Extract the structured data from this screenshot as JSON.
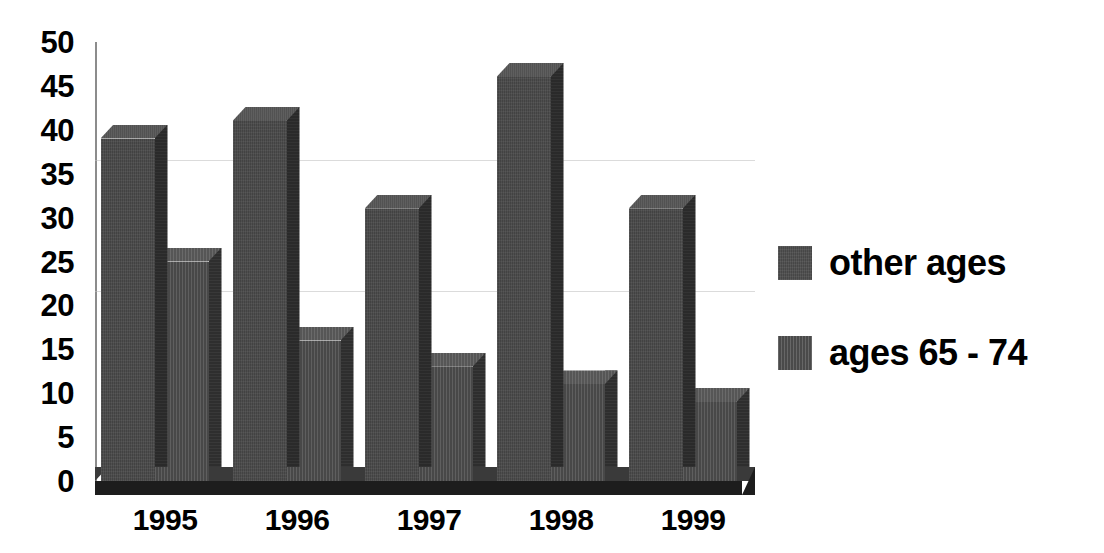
{
  "chart_data": {
    "type": "bar",
    "title": "",
    "subtitle": "",
    "xlabel": "",
    "ylabel": "",
    "categories": [
      "1995",
      "1996",
      "1997",
      "1998",
      "1999"
    ],
    "series": [
      {
        "name": "other ages",
        "values": [
          39,
          41,
          31,
          46,
          31
        ]
      },
      {
        "name": "ages 65 - 74",
        "values": [
          25,
          16,
          13,
          11,
          9
        ]
      }
    ],
    "ylim": [
      0,
      50
    ],
    "y_ticks": [
      0,
      5,
      10,
      15,
      20,
      25,
      30,
      35,
      40,
      45,
      50
    ],
    "y_tick_labels": [
      "0",
      "5",
      "10",
      "15",
      "20",
      "25",
      "30",
      "35",
      "40",
      "45",
      "50"
    ],
    "grid": true,
    "grid_axis": "y",
    "legend_position": "right",
    "style": "3d-clustered-column",
    "bar_color_other_ages": "#494949",
    "bar_color_ages_65_74": "#4d4d4d",
    "axis_color": "#8c8c8c",
    "text_color": "#000000",
    "background_color": "#ffffff"
  },
  "axes": {
    "y": {
      "ticks": [
        {
          "label": "50",
          "value": 50
        },
        {
          "label": "45",
          "value": 45
        },
        {
          "label": "40",
          "value": 40
        },
        {
          "label": "35",
          "value": 35
        },
        {
          "label": "30",
          "value": 30
        },
        {
          "label": "25",
          "value": 25
        },
        {
          "label": "20",
          "value": 20
        },
        {
          "label": "15",
          "value": 15
        },
        {
          "label": "10",
          "value": 10
        },
        {
          "label": "5",
          "value": 5
        },
        {
          "label": "0",
          "value": 0
        }
      ]
    },
    "x": {
      "ticks": [
        {
          "label": "1995"
        },
        {
          "label": "1996"
        },
        {
          "label": "1997"
        },
        {
          "label": "1998"
        },
        {
          "label": "1999"
        }
      ]
    }
  },
  "legend": {
    "items": [
      {
        "label": "other ages",
        "swatch": "swatch-other-ages"
      },
      {
        "label": "ages 65 - 74",
        "swatch": "swatch-ages-65-74"
      }
    ]
  }
}
